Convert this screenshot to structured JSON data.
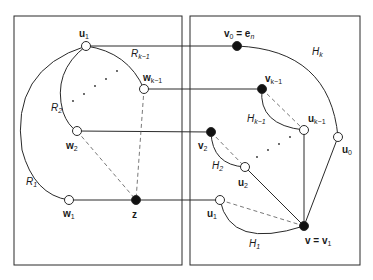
{
  "diagram": {
    "type": "graph",
    "colors": {
      "line": "#2a2a2a",
      "dashed": "#555555",
      "filled_node": "#111111",
      "open_node": "#ffffff"
    },
    "boxes": [
      {
        "id": "left",
        "x": 14,
        "y": 16,
        "w": 168,
        "h": 249
      },
      {
        "id": "right",
        "x": 190,
        "y": 16,
        "w": 170,
        "h": 249
      }
    ],
    "nodes": [
      {
        "id": "u1_left",
        "label": "u",
        "sub": "1",
        "filled": false,
        "x": 86,
        "y": 46
      },
      {
        "id": "w_k1",
        "label": "w",
        "sub": "k−1",
        "filled": false,
        "x": 144,
        "y": 89
      },
      {
        "id": "w2",
        "label": "w",
        "sub": "2",
        "filled": false,
        "x": 77,
        "y": 131
      },
      {
        "id": "w1",
        "label": "w",
        "sub": "1",
        "filled": false,
        "x": 69,
        "y": 200
      },
      {
        "id": "z",
        "label": "z",
        "sub": "",
        "filled": true,
        "x": 136,
        "y": 200
      },
      {
        "id": "v0",
        "label": "v",
        "sub": "0",
        "suffix": " = e",
        "suffix_sub": "n",
        "filled": true,
        "x": 237,
        "y": 46
      },
      {
        "id": "v_k1",
        "label": "v",
        "sub": "k−1",
        "filled": true,
        "x": 262,
        "y": 89
      },
      {
        "id": "v2",
        "label": "v",
        "sub": "2",
        "filled": true,
        "x": 211,
        "y": 132
      },
      {
        "id": "u_k1",
        "label": "u",
        "sub": "k−1",
        "filled": false,
        "x": 304,
        "y": 130
      },
      {
        "id": "u0",
        "label": "u",
        "sub": "0",
        "filled": false,
        "x": 338,
        "y": 137
      },
      {
        "id": "u2",
        "label": "u",
        "sub": "2",
        "filled": false,
        "x": 245,
        "y": 167
      },
      {
        "id": "u1_right",
        "label": "u",
        "sub": "1",
        "filled": false,
        "x": 220,
        "y": 200
      },
      {
        "id": "v",
        "label": "v = v",
        "sub": "1",
        "filled": true,
        "x": 304,
        "y": 226
      }
    ],
    "region_labels": [
      {
        "text": "R",
        "sub": "k−1",
        "x": 131,
        "y": 54
      },
      {
        "text": "R",
        "sub": "2",
        "x": 50,
        "y": 107
      },
      {
        "text": "R",
        "sub": "1",
        "x": 26,
        "y": 182
      },
      {
        "text": "H",
        "sub": "k",
        "x": 310,
        "y": 51
      },
      {
        "text": "H",
        "sub": "k−1",
        "x": 246,
        "y": 118
      },
      {
        "text": "H",
        "sub": "2",
        "x": 212,
        "y": 165
      },
      {
        "text": "H",
        "sub": "1",
        "x": 249,
        "y": 244
      }
    ],
    "node_labels": {
      "u1_left": "u",
      "w_k1": "w",
      "w2": "w",
      "w1": "w",
      "z": "z",
      "v0": "v",
      "v_k1": "v",
      "v2": "v",
      "u_k1": "u",
      "u0": "u",
      "u2": "u",
      "u1_right": "u",
      "v": "v = v"
    },
    "ellipsis": "· · · · ·"
  }
}
